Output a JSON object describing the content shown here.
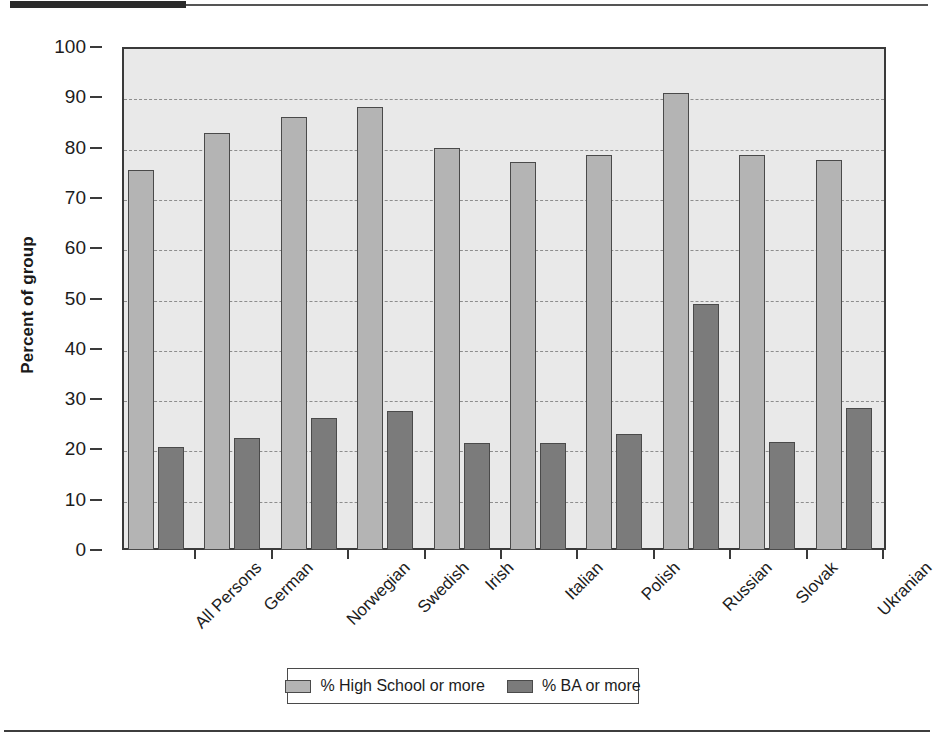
{
  "chart_data": {
    "type": "bar",
    "title": "",
    "xlabel": "",
    "ylabel": "Percent of group",
    "ylim": [
      0,
      100
    ],
    "ytick_step": 10,
    "yticks": [
      100,
      90,
      80,
      70,
      60,
      50,
      40,
      30,
      20,
      10,
      0
    ],
    "grid": true,
    "grid_axis": "y",
    "legend_position": "bottom-center",
    "categories": [
      "All Persons",
      "German",
      "Norwegian",
      "Swedish",
      "Irish",
      "Italian",
      "Polish",
      "Russian",
      "Slovak",
      "Ukranian"
    ],
    "series": [
      {
        "name": "% High School or more",
        "color": "#b4b4b4",
        "values": [
          75.6,
          83.0,
          86.0,
          88.0,
          80.0,
          77.2,
          78.5,
          90.8,
          78.5,
          77.5
        ]
      },
      {
        "name": "% BA or more",
        "color": "#7b7b7b",
        "values": [
          20.5,
          22.3,
          26.3,
          27.6,
          21.3,
          21.3,
          23.0,
          49.0,
          21.5,
          28.2
        ]
      }
    ]
  },
  "legend": {
    "entries": [
      {
        "label": "% High School or more",
        "swatch": "light-gray-swatch"
      },
      {
        "label": "% BA or more",
        "swatch": "dark-gray-swatch"
      }
    ]
  },
  "axis": {
    "y_title": "Percent of group"
  },
  "colors": {
    "series_high_school": "#b4b4b4",
    "series_ba": "#7b7b7b",
    "plot_background": "#e9e9e9",
    "axis_line": "#3a3a3a",
    "gridline": "#8d8d8d",
    "page_background": "#ffffff",
    "rule_dark": "#2b2b2b"
  }
}
